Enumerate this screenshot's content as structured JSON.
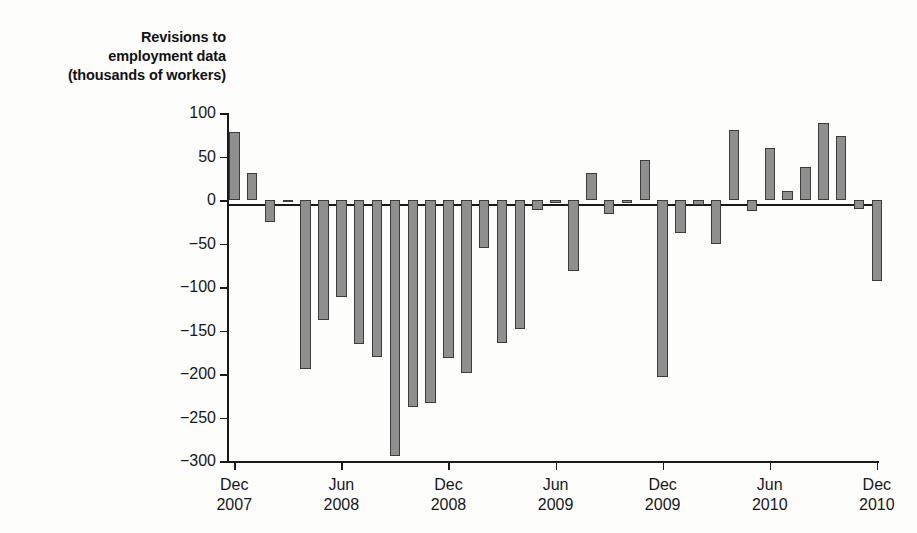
{
  "chart_data": {
    "type": "bar",
    "title": "Revisions to employment data (thousands of workers)",
    "title_lines": [
      "Revisions to",
      "employment data",
      "(thousands of workers)"
    ],
    "xlabel": "",
    "ylabel": "",
    "ylim": [
      -300,
      100
    ],
    "yticks": [
      100,
      50,
      0,
      -50,
      -100,
      -150,
      -200,
      -250,
      -300
    ],
    "ytick_labels": [
      "100",
      "50",
      "0",
      "−50",
      "−100",
      "−150",
      "−200",
      "−250",
      "−300"
    ],
    "grid": false,
    "legend": null,
    "bar_color": "#8f8f8f",
    "bar_edge_color": "#3c3c3c",
    "axis_color": "#1a1a1a",
    "xtick_labels": [
      {
        "month": "Dec",
        "year": "2007",
        "index": 0
      },
      {
        "month": "Jun",
        "year": "2008",
        "index": 6
      },
      {
        "month": "Dec",
        "year": "2008",
        "index": 12
      },
      {
        "month": "Jun",
        "year": "2009",
        "index": 18
      },
      {
        "month": "Dec",
        "year": "2009",
        "index": 24
      },
      {
        "month": "Jun",
        "year": "2010",
        "index": 30
      },
      {
        "month": "Dec",
        "year": "2010",
        "index": 36
      }
    ],
    "categories": [
      "Dec 2007",
      "Jan 2008",
      "Feb 2008",
      "Mar 2008",
      "Apr 2008",
      "May 2008",
      "Jun 2008",
      "Jul 2008",
      "Aug 2008",
      "Sep 2008",
      "Oct 2008",
      "Nov 2008",
      "Dec 2008",
      "Jan 2009",
      "Feb 2009",
      "Mar 2009",
      "Apr 2009",
      "May 2009",
      "Jun 2009",
      "Jul 2009",
      "Aug 2009",
      "Sep 2009",
      "Oct 2009",
      "Nov 2009",
      "Dec 2009",
      "Jan 2010",
      "Feb 2010",
      "Mar 2010",
      "Apr 2010",
      "May 2010",
      "Jun 2010",
      "Jul 2010",
      "Aug 2010",
      "Sep 2010",
      "Oct 2010",
      "Nov 2010",
      "Dec 2010"
    ],
    "values": [
      78,
      31,
      -25,
      -2,
      -194,
      -138,
      -112,
      -165,
      -180,
      -294,
      -238,
      -233,
      -182,
      -199,
      -55,
      -164,
      -148,
      -12,
      -3,
      -82,
      31,
      -16,
      -3,
      46,
      -203,
      -38,
      -6,
      -50,
      80,
      -13,
      60,
      10,
      38,
      89,
      74,
      -10,
      -93
    ]
  }
}
